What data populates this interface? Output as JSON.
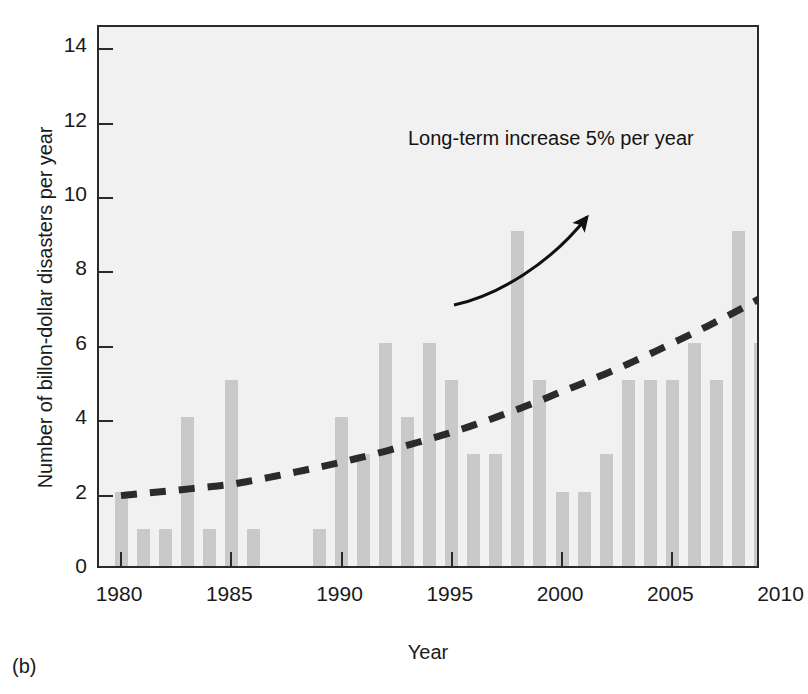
{
  "panel": {
    "label": "(b)"
  },
  "chart_data": {
    "type": "bar",
    "title": "",
    "xlabel": "Year",
    "ylabel": "Number of billon-dollar disasters per year",
    "xlim": [
      1979.3,
      1981.0
    ],
    "ylim": [
      0,
      14.6
    ],
    "grid": false,
    "legend_position": "none",
    "x_tick_labels": [
      "1980",
      "1985",
      "1990",
      "1995",
      "2000",
      "2005",
      "2010"
    ],
    "x_ticks": [
      1980,
      1985,
      1990,
      1995,
      2000,
      2005,
      2010
    ],
    "y_tick_labels": [
      "0",
      "2",
      "4",
      "6",
      "8",
      "10",
      "12",
      "14"
    ],
    "y_ticks": [
      0,
      2,
      4,
      6,
      8,
      10,
      12,
      14
    ],
    "categories": [
      1980,
      1981,
      1982,
      1983,
      1984,
      1985,
      1986,
      1987,
      1988,
      1989,
      1990,
      1991,
      1992,
      1993,
      1994,
      1995,
      1996,
      1997,
      1998,
      1999,
      2000,
      2001,
      2002,
      2003,
      2004,
      2005,
      2006,
      2007,
      2008,
      2009,
      2010,
      2011
    ],
    "values": [
      2,
      1,
      1,
      4,
      1,
      5,
      1,
      0,
      0,
      1,
      4,
      3,
      6,
      4,
      6,
      5,
      3,
      3,
      9,
      5,
      2,
      2,
      3,
      5,
      5,
      5,
      6,
      5,
      9,
      6,
      4,
      14
    ],
    "series": [
      {
        "name": "Number of billon-dollar disasters per year",
        "type": "bar",
        "color": "#c9c9c9",
        "values": [
          2,
          1,
          1,
          4,
          1,
          5,
          1,
          0,
          0,
          1,
          4,
          3,
          6,
          4,
          6,
          5,
          3,
          3,
          9,
          5,
          2,
          2,
          3,
          5,
          5,
          5,
          6,
          5,
          9,
          6,
          4,
          14
        ]
      },
      {
        "name": "Long-term exponential trend",
        "type": "line",
        "style": "dashed",
        "color": "#2b2b2b",
        "x": [
          1980,
          1985,
          1990,
          1995,
          2000,
          2005,
          2011
        ],
        "values": [
          2.0,
          2.3,
          2.9,
          3.7,
          4.8,
          6.1,
          8.0
        ]
      }
    ],
    "annotations": [
      {
        "name": "trend-annotation",
        "text": "Long-term increase 5% per year",
        "x": 1998,
        "y": 11.0
      }
    ]
  },
  "colors": {
    "bar": "#c9c9c9",
    "plot_background": "#f1f1f1",
    "axis": "#2a2a2a",
    "trend_line": "#2b2b2b",
    "text": "#1a1a1a"
  }
}
